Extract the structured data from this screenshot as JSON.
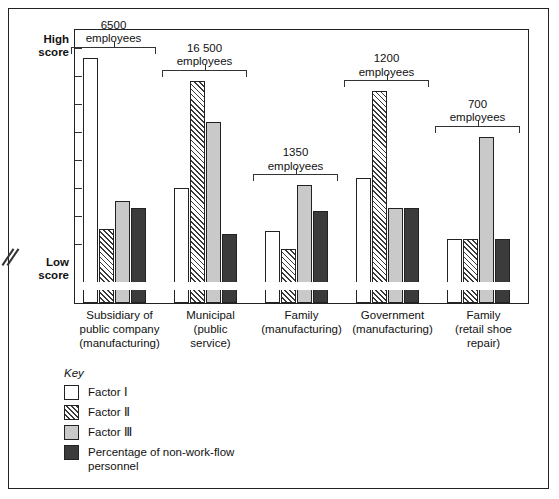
{
  "chart_data": {
    "type": "bar",
    "title": "",
    "subtitle": "",
    "xlabel": "",
    "ylabel": "",
    "grid": false,
    "legend_position": "bottom-left",
    "axis_break": true,
    "y_axis": {
      "top_label": "High\nscore",
      "bottom_label": "Low\nscore",
      "tick_count": 8,
      "ylim": [
        0,
        100
      ],
      "scale_note": "qualitative score axis, unlabeled ticks"
    },
    "categories": [
      "Subsidiary of\npublic company\n(manufacturing)",
      "Municipal\n(public\nservice)",
      "Family\n(manufacturing)",
      "Government\n(manufacturing)",
      "Family\n(retail shoe\nrepair)"
    ],
    "annotations": [
      "6500\nemployees",
      "16 500\nemployees",
      "1350\nemployees",
      "1200\nemployees",
      "700\nemployees"
    ],
    "employee_counts": [
      6500,
      16500,
      1350,
      1200,
      700
    ],
    "series": [
      {
        "name": "Factor I",
        "style": "white",
        "values": [
          93,
          42,
          25,
          46,
          22
        ]
      },
      {
        "name": "Factor II",
        "style": "hatch",
        "values": [
          26,
          84,
          18,
          80,
          22
        ]
      },
      {
        "name": "Factor III",
        "style": "gray",
        "values": [
          37,
          68,
          43,
          34,
          62
        ]
      },
      {
        "name": "Percentage of non-work-flow\npersonnel",
        "style": "dark",
        "values": [
          34,
          24,
          33,
          34,
          22
        ]
      }
    ]
  },
  "legend": {
    "title": "Key",
    "items": [
      {
        "label": "Factor Ⅰ",
        "swatch": "white"
      },
      {
        "label": "Factor Ⅱ",
        "swatch": "hatch"
      },
      {
        "label": "Factor Ⅲ",
        "swatch": "gray"
      },
      {
        "label": "Percentage of non-work-flow\npersonnel",
        "swatch": "dark"
      }
    ]
  },
  "colors": {
    "white": "#ffffff",
    "gray": "#c9c9c9",
    "dark": "#3b3b3b",
    "hatch_line": "#3a3a3a",
    "outline": "#222222"
  }
}
